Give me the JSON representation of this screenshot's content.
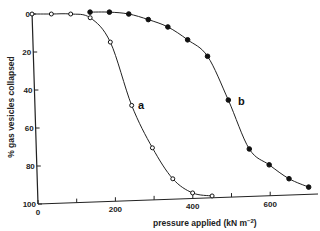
{
  "chart_data": {
    "type": "line",
    "title": "",
    "xlabel": "pressure applied (kN m⁻²)",
    "ylabel": "% gas vesicles collapsed",
    "xlim": [
      0,
      720
    ],
    "ylim": [
      100,
      0
    ],
    "y_inverted": true,
    "grid": false,
    "legend": "inline labels",
    "x_ticks": [
      0,
      100,
      200,
      300,
      400,
      500,
      600
    ],
    "x_tick_labels": [
      "0",
      "",
      "200",
      "",
      "400",
      "",
      "600"
    ],
    "y_ticks": [
      0,
      20,
      40,
      60,
      80,
      100
    ],
    "y_tick_labels": [
      "0",
      "20",
      "40",
      "60",
      "80",
      "100"
    ],
    "series": [
      {
        "name": "a",
        "marker": "open-circle",
        "x": [
          0,
          50,
          100,
          150,
          200,
          250,
          300,
          350,
          400,
          450
        ],
        "values": [
          0,
          0,
          0,
          2,
          15,
          49,
          72,
          89,
          97,
          99
        ]
      },
      {
        "name": "b",
        "marker": "filled-circle",
        "x": [
          150,
          200,
          250,
          300,
          350,
          400,
          450,
          500,
          550,
          600,
          650,
          700
        ],
        "values": [
          -1,
          -1,
          0,
          3,
          7,
          14,
          23,
          47,
          74,
          83,
          91,
          96
        ]
      }
    ]
  },
  "labels": {
    "xlabel_main": "pressure applied (kN m",
    "xlabel_sup": "−2",
    "xlabel_close": ")",
    "ylabel": "% gas vesicles collapsed",
    "series_a": "a",
    "series_b": "b"
  }
}
